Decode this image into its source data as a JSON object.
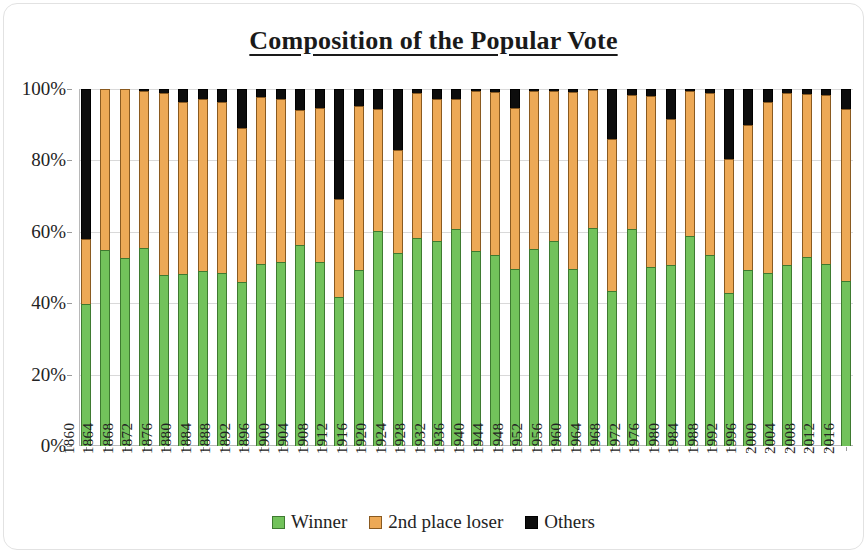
{
  "chart_data": {
    "type": "bar",
    "subtype": "stacked-column-100",
    "title": "Composition of the Popular Vote",
    "xlabel": "",
    "ylabel": "",
    "ylim": [
      0,
      100
    ],
    "ytick_labels": [
      "0%",
      "20%",
      "40%",
      "60%",
      "80%",
      "100%"
    ],
    "ytick_values": [
      0,
      20,
      40,
      60,
      80,
      100
    ],
    "grid": true,
    "legend_position": "bottom",
    "categories": [
      "1860",
      "1864",
      "1868",
      "1872",
      "1876",
      "1880",
      "1884",
      "1888",
      "1892",
      "1896",
      "1900",
      "1904",
      "1908",
      "1912",
      "1916",
      "1920",
      "1924",
      "1928",
      "1932",
      "1936",
      "1940",
      "1944",
      "1948",
      "1952",
      "1956",
      "1960",
      "1964",
      "1968",
      "1972",
      "1976",
      "1980",
      "1984",
      "1988",
      "1992",
      "1996",
      "2000",
      "2004",
      "2008",
      "2012",
      "2016"
    ],
    "series": [
      {
        "name": "Winner",
        "color": "#72C25B",
        "values": [
          39.8,
          55.0,
          52.7,
          55.6,
          47.9,
          48.3,
          48.9,
          48.6,
          46.0,
          51.0,
          51.6,
          56.4,
          51.6,
          41.8,
          49.2,
          60.3,
          54.0,
          58.2,
          57.4,
          60.8,
          54.7,
          53.4,
          49.6,
          55.2,
          57.4,
          49.7,
          61.1,
          43.4,
          60.7,
          50.1,
          50.7,
          58.8,
          53.4,
          43.0,
          49.2,
          48.4,
          50.7,
          52.9,
          51.1,
          46.1
        ]
      },
      {
        "name": "2nd place loser",
        "color": "#EDA956",
        "values": [
          18.1,
          45.0,
          47.3,
          43.8,
          50.9,
          48.2,
          48.3,
          47.8,
          43.0,
          46.7,
          45.5,
          37.6,
          43.0,
          27.4,
          46.1,
          34.1,
          28.8,
          40.8,
          39.7,
          36.5,
          44.8,
          45.9,
          45.1,
          44.3,
          42.0,
          49.6,
          38.5,
          42.7,
          37.5,
          48.0,
          41.0,
          40.6,
          45.6,
          37.4,
          40.7,
          47.9,
          48.3,
          45.7,
          47.2,
          48.2
        ]
      },
      {
        "name": "Others",
        "color": "#0d0d0d",
        "values": [
          42.1,
          0.0,
          0.0,
          0.6,
          1.2,
          3.5,
          2.8,
          3.6,
          11.0,
          2.3,
          2.9,
          6.0,
          5.4,
          30.8,
          4.7,
          5.6,
          17.2,
          1.0,
          2.9,
          2.7,
          0.5,
          0.7,
          5.3,
          0.5,
          0.6,
          0.7,
          0.4,
          13.9,
          1.8,
          1.9,
          8.3,
          0.6,
          1.0,
          19.6,
          10.1,
          3.7,
          1.0,
          1.4,
          1.7,
          5.7
        ]
      }
    ]
  },
  "legend": {
    "items": [
      {
        "label": "Winner",
        "swatch": "green-swatch"
      },
      {
        "label": "2nd place loser",
        "swatch": "orange-swatch"
      },
      {
        "label": "Others",
        "swatch": "black-swatch"
      }
    ]
  }
}
